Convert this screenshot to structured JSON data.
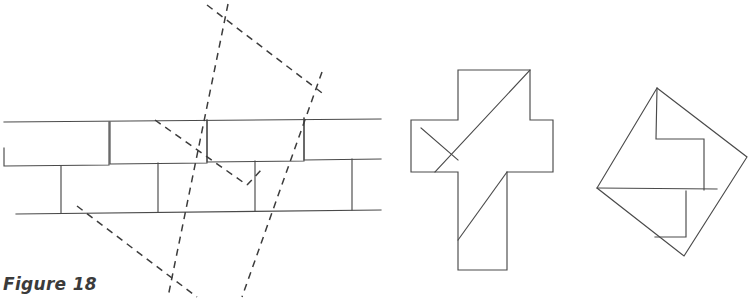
{
  "figure": {
    "caption": "Figure 18",
    "title": "Figure 18",
    "stroke_color": "#4a4a4a",
    "dashed_color": "#3c3c3c",
    "background_color": "#ffffff"
  },
  "panels": [
    {
      "name": "tessellation-panel",
      "label": "Cross tessellation with dashed square lattice",
      "bounds": {
        "x": 0,
        "y": 0,
        "width": 385,
        "height": 301
      }
    },
    {
      "name": "cross-panel",
      "label": "Dissected Greek cross",
      "bounds": {
        "x": 400,
        "y": 60,
        "width": 165,
        "height": 220
      }
    },
    {
      "name": "square-panel",
      "label": "Reassembled tilted square",
      "bounds": {
        "x": 585,
        "y": 75,
        "width": 167,
        "height": 195
      }
    }
  ],
  "geometry": {
    "tessellation": {
      "name": "cross-tessellation",
      "top_rail": {
        "x1": 4,
        "y1": 122,
        "x2": 381,
        "y2": 119
      },
      "bottom_rail": {
        "x1": 16,
        "y1": 214,
        "x2": 381,
        "y2": 210
      },
      "period": 97,
      "unit_paths": [
        "M 4 166 L 4 148",
        "M 4 166 L 109 165 L 110 122",
        "M 61 166 L 61 213",
        "M 109 165 L 109 122",
        "M 110 164 L 207 163 L 207 120",
        "M 158 163 L 158 211",
        "M 207 162 L 304 161 L 304 118",
        "M 255 161 L 255 210",
        "M 304 160 L 381 159",
        "M 352 159 L 352 209"
      ]
    },
    "dashed_square": {
      "name": "dashed-lattice-square",
      "corners": [
        {
          "x": 218,
          "y": 22
        },
        {
          "x": 311,
          "y": 86
        },
        {
          "x": 182,
          "y": 283
        },
        {
          "x": 87,
          "y": 219
        }
      ],
      "extended_lines": [
        {
          "x1": 228,
          "y1": 4,
          "x2": 168,
          "y2": 297
        },
        {
          "x1": 322,
          "y1": 73,
          "x2": 242,
          "y2": 296
        },
        {
          "x1": 207,
          "y1": 5,
          "x2": 325,
          "y2": 95
        },
        {
          "x1": 77,
          "y1": 206,
          "x2": 196,
          "y2": 296
        }
      ],
      "inner_marks": [
        {
          "x1": 155,
          "y1": 120,
          "x2": 247,
          "y2": 185
        },
        {
          "x1": 247,
          "y1": 185,
          "x2": 262,
          "y2": 169
        }
      ]
    },
    "cross": {
      "name": "greek-cross",
      "outline": "M 458 70 L 530 70 L 530 120 L 553 120 L 553 172 L 507 172 L 507 270 L 458 270 L 458 172 L 411 172 L 411 120 L 458 120 Z",
      "cuts": [
        {
          "from": {
            "x": 530,
            "y": 70
          },
          "to": {
            "x": 435,
            "y": 172
          }
        },
        {
          "from": {
            "x": 421,
            "y": 128
          },
          "to": {
            "x": 458,
            "y": 160
          }
        },
        {
          "from": {
            "x": 507,
            "y": 172
          },
          "to": {
            "x": 458,
            "y": 240
          }
        }
      ]
    },
    "square": {
      "name": "tilted-square",
      "corners": [
        {
          "x": 657,
          "y": 88
        },
        {
          "x": 747,
          "y": 157
        },
        {
          "x": 684,
          "y": 256
        },
        {
          "x": 597,
          "y": 188
        }
      ],
      "inner_paths": [
        "M 657 88 L 656 139 L 704 139 L 704 190",
        "M 597 188 L 717 189",
        "M 686 192 L 686 237 L 655 237"
      ]
    }
  }
}
